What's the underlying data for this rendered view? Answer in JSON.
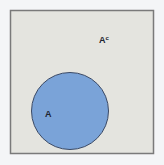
{
  "diagram": {
    "type": "venn",
    "universe": {
      "label": "A",
      "label_superscript": "c",
      "fill": "#e4e4df",
      "stroke": "#7a7a7a"
    },
    "set_a": {
      "label": "A",
      "fill": "#7aa3d8",
      "stroke": "#3b4a66"
    },
    "background": "#f4f5f7"
  }
}
